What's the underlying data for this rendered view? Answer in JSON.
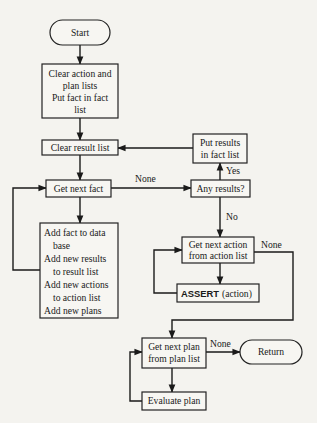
{
  "nodes": {
    "start": {
      "label": "Start"
    },
    "clear_lists": {
      "lines": [
        "Clear action and",
        "plan lists",
        "Put fact in fact",
        "list"
      ]
    },
    "clear_result": {
      "label": "Clear result list"
    },
    "get_next_fact": {
      "label": "Get next fact"
    },
    "add_fact": {
      "lines": [
        "Add fact to data",
        "base",
        "Add new results",
        "to result list",
        "Add new actions",
        "to action list",
        "Add new plans"
      ]
    },
    "put_results": {
      "lines": [
        "Put results",
        "in fact list"
      ]
    },
    "any_results": {
      "label": "Any results?"
    },
    "get_next_action": {
      "lines": [
        "Get next action",
        "from action list"
      ]
    },
    "assert_action": {
      "keyword": "ASSERT",
      "arg": "(action)"
    },
    "get_next_plan": {
      "lines": [
        "Get next plan",
        "from plan list"
      ]
    },
    "evaluate_plan": {
      "label": "Evaluate plan"
    },
    "return": {
      "label": "Return"
    }
  },
  "edge_labels": {
    "fact_none": "None",
    "yes": "Yes",
    "no": "No",
    "action_none": "None",
    "plan_none": "None"
  }
}
